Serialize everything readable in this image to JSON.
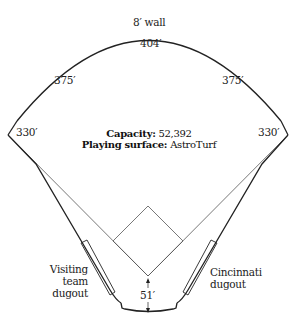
{
  "diagram": {
    "type": "ballpark-field-diagram",
    "wall_label": "8′ wall",
    "distances": {
      "center_field": "404′",
      "left_center": "375′",
      "right_center": "375′",
      "left_field_line": "330′",
      "right_field_line": "330′",
      "backstop": "51′"
    },
    "info": {
      "capacity_label": "Capacity:",
      "capacity_value": "52,392",
      "surface_label": "Playing surface:",
      "surface_value": "AstroTurf"
    },
    "dugouts": {
      "visiting_line1": "Visiting",
      "visiting_line2": "team",
      "visiting_line3": "dugout",
      "home_line1": "Cincinnati",
      "home_line2": "dugout"
    },
    "colors": {
      "line": "#222222",
      "thin_line": "#555555",
      "background": "#ffffff"
    }
  }
}
